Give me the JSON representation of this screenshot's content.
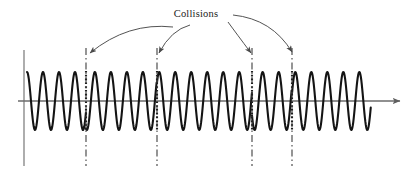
{
  "figure": {
    "annotation_label": "Collisions",
    "colors": {
      "wave": "#141414",
      "axis": "#6b6b6b",
      "collision_marker": "#1f1f1f",
      "arrow": "#4a4a4a",
      "background": "#ffffff",
      "text": "#1a1a1a"
    },
    "axes": {
      "horizontal_axis_y": 101,
      "horizontal_axis_x_start": 18,
      "horizontal_axis_x_end": 400,
      "vertical_axis_x": 24,
      "vertical_axis_y_top": 50,
      "vertical_axis_y_bottom": 166,
      "has_right_arrowhead": true,
      "grid": false
    }
  },
  "chart_data": {
    "type": "line",
    "title": "",
    "subtitle": "",
    "xlabel": "",
    "ylabel": "",
    "xlim": [
      18,
      400
    ],
    "ylim": [
      -1.2,
      1.2
    ],
    "grid": false,
    "legend_position": "none",
    "series": [
      {
        "name": "oscillation",
        "description": "Sinusoidal oscillation with abrupt phase resets at collision events",
        "baseline_y": 101,
        "amplitude": 29,
        "period_px": 16.0,
        "x_start": 27,
        "x_end": 371,
        "phase_segments": [
          {
            "x_start": 27,
            "x_end": 86,
            "phase_deg": 90
          },
          {
            "x_start": 86,
            "x_end": 157,
            "phase_deg": 250
          },
          {
            "x_start": 157,
            "x_end": 252,
            "phase_deg": 40
          },
          {
            "x_start": 252,
            "x_end": 292,
            "phase_deg": 210
          },
          {
            "x_start": 292,
            "x_end": 371,
            "phase_deg": 15
          }
        ]
      }
    ],
    "annotations": [
      {
        "label": "Collisions",
        "label_x": 196,
        "label_y": 17,
        "points_to": [
          86,
          157,
          252,
          292
        ]
      }
    ],
    "collisions": [
      {
        "index": 1,
        "x": 86,
        "line_y_top": 48,
        "line_y_bottom": 166
      },
      {
        "index": 2,
        "x": 157,
        "line_y_top": 48,
        "line_y_bottom": 166
      },
      {
        "index": 3,
        "x": 252,
        "line_y_top": 48,
        "line_y_bottom": 166
      },
      {
        "index": 4,
        "x": 292,
        "line_y_top": 48,
        "line_y_bottom": 166
      }
    ],
    "arrows": [
      {
        "id": "arrow-to-collision-1",
        "from_x": 173,
        "from_y": 27,
        "to_x": 90,
        "to_y": 53,
        "curve_x": 128,
        "curve_y": 22
      },
      {
        "id": "arrow-to-collision-2",
        "from_x": 190,
        "from_y": 25,
        "to_x": 159,
        "to_y": 53,
        "curve_x": 171,
        "curve_y": 30
      },
      {
        "id": "arrow-to-collision-3",
        "from_x": 228,
        "from_y": 22,
        "to_x": 251,
        "to_y": 53,
        "curve_x": 236,
        "curve_y": 33
      },
      {
        "id": "arrow-to-collision-4",
        "from_x": 233,
        "from_y": 15,
        "to_x": 292,
        "to_y": 52,
        "curve_x": 272,
        "curve_y": 19
      }
    ]
  }
}
